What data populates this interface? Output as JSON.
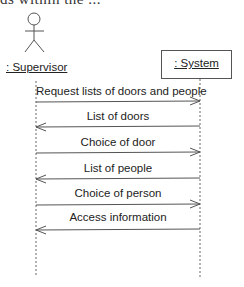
{
  "cutoff_text": "ds within the ...",
  "actor": {
    "label": ": Supervisor",
    "icon": "stick-figure-actor-icon"
  },
  "object": {
    "label": ": System"
  },
  "messages": [
    {
      "label": "Request lists of doors and people",
      "direction": "to-system"
    },
    {
      "label": "List of doors",
      "direction": "to-supervisor"
    },
    {
      "label": "Choice of door",
      "direction": "to-system"
    },
    {
      "label": "List of people",
      "direction": "to-supervisor"
    },
    {
      "label": "Choice of person",
      "direction": "to-system"
    },
    {
      "label": "Access information",
      "direction": "to-supervisor"
    }
  ],
  "colors": {
    "line": "#555555",
    "text": "#222222",
    "background": "#ffffff"
  }
}
